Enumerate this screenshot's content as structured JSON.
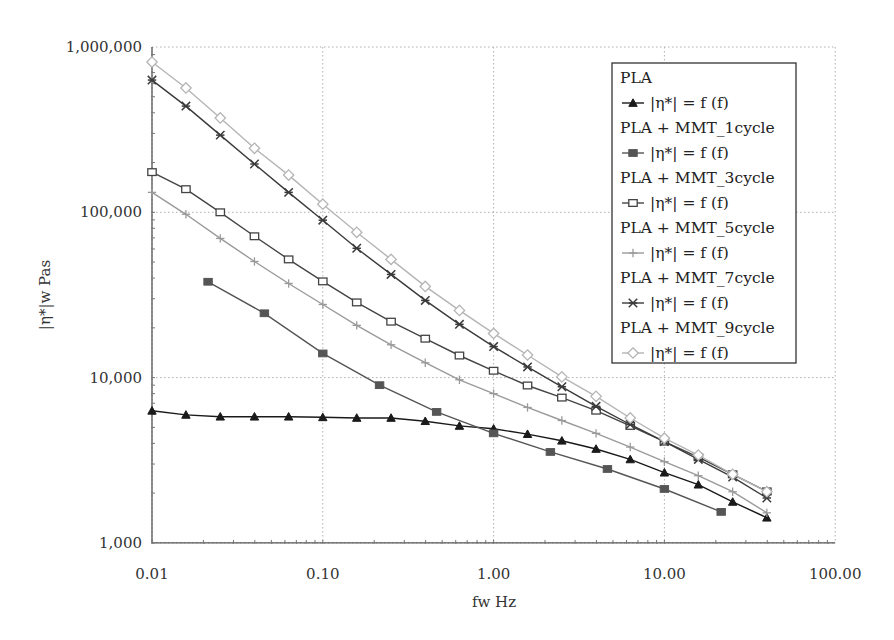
{
  "chart_data": {
    "type": "line",
    "title": "",
    "xlabel": "fw Hz",
    "ylabel": "|η*|w Pas",
    "xscale": "log",
    "yscale": "log",
    "xlim": [
      0.01,
      100
    ],
    "ylim": [
      1000,
      1000000
    ],
    "grid": true,
    "legend_position": "upper right (inside)",
    "x_ticks": [
      "0.01",
      "0.10",
      "1.00",
      "10.00",
      "100.00"
    ],
    "x_tick_values": [
      0.01,
      0.1,
      1,
      10,
      100
    ],
    "y_ticks": [
      "1,000",
      "10,000",
      "100,000",
      "1,000,000"
    ],
    "y_tick_values": [
      1000,
      10000,
      100000,
      1000000
    ],
    "series": [
      {
        "name": "PLA",
        "legend_label": "|η*| = f  (f)",
        "marker": "triangle-filled",
        "color": "#1a1a1a",
        "x": [
          0.01,
          0.0158,
          0.0251,
          0.0398,
          0.0631,
          0.1,
          0.158,
          0.251,
          0.398,
          0.631,
          1.0,
          1.58,
          2.51,
          3.98,
          6.31,
          10.0,
          15.8,
          25.1,
          39.8
        ],
        "values": [
          6300,
          5950,
          5800,
          5800,
          5800,
          5750,
          5700,
          5700,
          5450,
          5100,
          4900,
          4550,
          4150,
          3700,
          3200,
          2660,
          2250,
          1770,
          1420
        ]
      },
      {
        "name": "PLA + MMT_1cycle",
        "legend_label": "|η*| = f  (f)",
        "marker": "square-filled",
        "color": "#555555",
        "x": [
          0.0213,
          0.0455,
          0.1,
          0.215,
          0.464,
          1.0,
          2.15,
          4.64,
          10.0,
          21.5
        ],
        "values": [
          38000,
          24500,
          14000,
          9000,
          6200,
          4600,
          3550,
          2800,
          2120,
          1540
        ]
      },
      {
        "name": "PLA + MMT_3cycle",
        "legend_label": "|η*| = f  (f)",
        "marker": "square-open",
        "color": "#444444",
        "x": [
          0.01,
          0.0158,
          0.0251,
          0.0398,
          0.0631,
          0.1,
          0.158,
          0.251,
          0.398,
          0.631,
          1.0,
          1.58,
          2.51,
          3.98,
          6.31,
          10.0,
          15.8,
          25.1,
          39.8
        ],
        "values": [
          175000,
          138000,
          100000,
          71600,
          51900,
          38200,
          28500,
          21800,
          17200,
          13600,
          11000,
          8960,
          7570,
          6310,
          5100,
          4100,
          3300,
          2600,
          2050
        ]
      },
      {
        "name": "PLA + MMT_5cycle",
        "legend_label": "|η*| = f  (f)",
        "marker": "plus",
        "color": "#9a9a9a",
        "x": [
          0.01,
          0.0158,
          0.0251,
          0.0398,
          0.0631,
          0.1,
          0.158,
          0.251,
          0.398,
          0.631,
          1.0,
          1.58,
          2.51,
          3.98,
          6.31,
          10.0,
          15.8,
          25.1,
          39.8
        ],
        "values": [
          132000,
          97300,
          69500,
          50400,
          37100,
          27700,
          20700,
          15800,
          12300,
          9700,
          8000,
          6600,
          5500,
          4600,
          3800,
          3100,
          2550,
          2040,
          1520
        ]
      },
      {
        "name": "PLA + MMT_7cycle",
        "legend_label": "|η*| = f  (f)",
        "marker": "asterisk",
        "color": "#3a3a3a",
        "x": [
          0.01,
          0.0158,
          0.0251,
          0.0398,
          0.0631,
          0.1,
          0.158,
          0.251,
          0.398,
          0.631,
          1.0,
          1.58,
          2.51,
          3.98,
          6.31,
          10.0,
          15.8,
          25.1,
          39.8
        ],
        "values": [
          631000,
          439000,
          293000,
          196000,
          132000,
          89600,
          60600,
          42100,
          29300,
          21000,
          15400,
          11600,
          8800,
          6700,
          5200,
          4100,
          3200,
          2500,
          1870
        ]
      },
      {
        "name": "PLA + MMT_9cycle",
        "legend_label": "|η*| = f  (f)",
        "marker": "diamond-open",
        "color": "#b5b5b5",
        "x": [
          0.01,
          0.0158,
          0.0251,
          0.0398,
          0.0631,
          0.1,
          0.158,
          0.251,
          0.398,
          0.631,
          1.0,
          1.58,
          2.51,
          3.98,
          6.31,
          10.0,
          15.8,
          25.1,
          39.8
        ],
        "values": [
          811000,
          565000,
          372000,
          244000,
          168000,
          112000,
          75700,
          51900,
          35600,
          25500,
          18500,
          13700,
          10100,
          7700,
          5700,
          4300,
          3400,
          2600,
          2040
        ]
      }
    ]
  },
  "axes": {
    "x_title": "fw Hz",
    "y_title": "|η*|w Pas"
  },
  "legend": {
    "entries": [
      {
        "group": "PLA",
        "label": "|η*| = f  (f)"
      },
      {
        "group": "PLA + MMT_1cycle",
        "label": "|η*| = f  (f)"
      },
      {
        "group": "PLA + MMT_3cycle",
        "label": "|η*| = f  (f)"
      },
      {
        "group": "PLA + MMT_5cycle",
        "label": "|η*| = f  (f)"
      },
      {
        "group": "PLA + MMT_7cycle",
        "label": "|η*| = f  (f)"
      },
      {
        "group": "PLA + MMT_9cycle",
        "label": "|η*| = f  (f)"
      }
    ]
  }
}
